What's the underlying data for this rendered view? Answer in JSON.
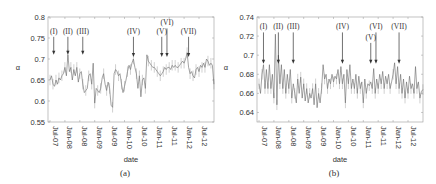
{
  "chart_data": [
    {
      "id": "a",
      "type": "line",
      "caption": "(a)",
      "xlabel": "date",
      "ylabel": "α",
      "ylim": [
        0.55,
        0.8
      ],
      "yticks": [
        0.55,
        0.6,
        0.65,
        0.7,
        0.75,
        0.8
      ],
      "ytick_labels": [
        "0.55",
        "0.6",
        "0.65",
        "0.7",
        "0.75",
        "0.8"
      ],
      "xticks": [
        "Jul-07",
        "Jan-08",
        "Jul-08",
        "Jan-09",
        "Jul-09",
        "Jan-10",
        "Jul-10",
        "Jan-11",
        "Jul-11",
        "Jan-12",
        "Jul-12"
      ],
      "grid": false,
      "annotations": [
        {
          "label": "(I)",
          "x_index": 0.25,
          "label_y": 0.76,
          "arrow_to": 0.71
        },
        {
          "label": "(II)",
          "x_index": 1.2,
          "label_y": 0.76,
          "arrow_to": 0.71
        },
        {
          "label": "(III)",
          "x_index": 2.2,
          "label_y": 0.76,
          "arrow_to": 0.71
        },
        {
          "label": "(IV)",
          "x_index": 5.6,
          "label_y": 0.76,
          "arrow_to": 0.705
        },
        {
          "label": "(V)",
          "x_index": 7.5,
          "label_y": 0.76,
          "arrow_to": 0.705
        },
        {
          "label": "(VI)",
          "x_index": 7.85,
          "label_y": 0.78,
          "arrow_to": 0.705
        },
        {
          "label": "(VII)",
          "x_index": 9.3,
          "label_y": 0.76,
          "arrow_to": 0.705
        }
      ],
      "series_summary": {
        "name": "α (weekly)",
        "points": [
          [
            0.0,
            0.65
          ],
          [
            0.1,
            0.66
          ],
          [
            0.2,
            0.64
          ],
          [
            0.3,
            0.635
          ],
          [
            0.4,
            0.65
          ],
          [
            0.5,
            0.64
          ],
          [
            0.6,
            0.655
          ],
          [
            0.7,
            0.65
          ],
          [
            0.8,
            0.66
          ],
          [
            0.9,
            0.665
          ],
          [
            1.0,
            0.68
          ],
          [
            1.1,
            0.66
          ],
          [
            1.2,
            0.71
          ],
          [
            1.3,
            0.67
          ],
          [
            1.4,
            0.68
          ],
          [
            1.5,
            0.65
          ],
          [
            1.6,
            0.675
          ],
          [
            1.7,
            0.66
          ],
          [
            1.8,
            0.68
          ],
          [
            1.9,
            0.645
          ],
          [
            2.0,
            0.665
          ],
          [
            2.1,
            0.67
          ],
          [
            2.2,
            0.64
          ],
          [
            2.3,
            0.62
          ],
          [
            2.4,
            0.625
          ],
          [
            2.5,
            0.63
          ],
          [
            2.6,
            0.66
          ],
          [
            2.7,
            0.665
          ],
          [
            2.8,
            0.64
          ],
          [
            2.9,
            0.69
          ],
          [
            3.0,
            0.595
          ],
          [
            3.1,
            0.63
          ],
          [
            3.2,
            0.625
          ],
          [
            3.3,
            0.62
          ],
          [
            3.4,
            0.63
          ],
          [
            3.5,
            0.655
          ],
          [
            3.6,
            0.665
          ],
          [
            3.7,
            0.64
          ],
          [
            3.8,
            0.625
          ],
          [
            3.9,
            0.645
          ],
          [
            4.0,
            0.63
          ],
          [
            4.1,
            0.59
          ],
          [
            4.2,
            0.585
          ],
          [
            4.3,
            0.665
          ],
          [
            4.4,
            0.675
          ],
          [
            4.5,
            0.67
          ],
          [
            4.6,
            0.66
          ],
          [
            4.7,
            0.665
          ],
          [
            4.8,
            0.64
          ],
          [
            4.9,
            0.62
          ],
          [
            5.0,
            0.635
          ],
          [
            5.1,
            0.65
          ],
          [
            5.2,
            0.67
          ],
          [
            5.3,
            0.685
          ],
          [
            5.4,
            0.675
          ],
          [
            5.5,
            0.69
          ],
          [
            5.6,
            0.7
          ],
          [
            5.7,
            0.68
          ],
          [
            5.8,
            0.665
          ],
          [
            5.9,
            0.63
          ],
          [
            6.0,
            0.66
          ],
          [
            6.1,
            0.61
          ],
          [
            6.2,
            0.65
          ],
          [
            6.3,
            0.655
          ],
          [
            6.4,
            0.63
          ],
          [
            6.5,
            0.71
          ],
          [
            6.6,
            0.695
          ],
          [
            6.7,
            0.69
          ],
          [
            6.8,
            0.685
          ],
          [
            6.9,
            0.68
          ],
          [
            7.0,
            0.68
          ],
          [
            7.1,
            0.675
          ],
          [
            7.2,
            0.67
          ],
          [
            7.3,
            0.665
          ],
          [
            7.4,
            0.66
          ],
          [
            7.5,
            0.665
          ],
          [
            7.6,
            0.67
          ],
          [
            7.7,
            0.68
          ],
          [
            7.8,
            0.675
          ],
          [
            7.9,
            0.68
          ],
          [
            8.0,
            0.68
          ],
          [
            8.1,
            0.675
          ],
          [
            8.2,
            0.685
          ],
          [
            8.3,
            0.68
          ],
          [
            8.4,
            0.685
          ],
          [
            8.5,
            0.68
          ],
          [
            8.6,
            0.68
          ],
          [
            8.7,
            0.685
          ],
          [
            8.8,
            0.69
          ],
          [
            8.9,
            0.695
          ],
          [
            9.0,
            0.69
          ],
          [
            9.1,
            0.7
          ],
          [
            9.2,
            0.715
          ],
          [
            9.3,
            0.68
          ],
          [
            9.4,
            0.665
          ],
          [
            9.5,
            0.67
          ],
          [
            9.6,
            0.66
          ],
          [
            9.7,
            0.655
          ],
          [
            9.8,
            0.675
          ],
          [
            9.9,
            0.68
          ],
          [
            10.0,
            0.67
          ],
          [
            10.1,
            0.685
          ],
          [
            10.2,
            0.68
          ],
          [
            10.3,
            0.69
          ],
          [
            10.4,
            0.68
          ],
          [
            10.5,
            0.7
          ],
          [
            10.6,
            0.695
          ],
          [
            10.7,
            0.685
          ],
          [
            10.8,
            0.69
          ],
          [
            10.9,
            0.685
          ],
          [
            11.0,
            0.64
          ]
        ]
      }
    },
    {
      "id": "b",
      "type": "line",
      "caption": "(b)",
      "xlabel": "date",
      "ylabel": "α",
      "ylim": [
        0.63,
        0.74
      ],
      "yticks": [
        0.64,
        0.66,
        0.68,
        0.7,
        0.72,
        0.74
      ],
      "ytick_labels": [
        "0.64",
        "0.66",
        "0.68",
        "0.7",
        "0.72",
        "0.74"
      ],
      "xticks": [
        "Jul-07",
        "Jan-08",
        "Jul-08",
        "Jan-09",
        "Jul-09",
        "Jan-10",
        "Jul-10",
        "Jan-11",
        "Jul-11",
        "Jan-12",
        "Jul-12"
      ],
      "grid": false,
      "annotations": [
        {
          "label": "(I)",
          "x_index": 0.3,
          "label_y": 0.727,
          "arrow_to": 0.691
        },
        {
          "label": "(II)",
          "x_index": 1.3,
          "label_y": 0.727,
          "arrow_to": 0.691
        },
        {
          "label": "(III)",
          "x_index": 2.3,
          "label_y": 0.727,
          "arrow_to": 0.691
        },
        {
          "label": "(IV)",
          "x_index": 5.6,
          "label_y": 0.727,
          "arrow_to": 0.691
        },
        {
          "label": "(V)",
          "x_index": 7.5,
          "label_y": 0.716,
          "arrow_to": 0.691
        },
        {
          "label": "(VI)",
          "x_index": 7.85,
          "label_y": 0.727,
          "arrow_to": 0.691
        },
        {
          "label": "(VII)",
          "x_index": 9.4,
          "label_y": 0.727,
          "arrow_to": 0.691
        }
      ],
      "series_summary": {
        "name": "α (weekly)",
        "points": [
          [
            0.0,
            0.67
          ],
          [
            0.1,
            0.66
          ],
          [
            0.2,
            0.68
          ],
          [
            0.3,
            0.69
          ],
          [
            0.4,
            0.665
          ],
          [
            0.5,
            0.685
          ],
          [
            0.6,
            0.665
          ],
          [
            0.7,
            0.69
          ],
          [
            0.8,
            0.665
          ],
          [
            0.9,
            0.68
          ],
          [
            1.0,
            0.655
          ],
          [
            1.1,
            0.722
          ],
          [
            1.2,
            0.648
          ],
          [
            1.3,
            0.7
          ],
          [
            1.4,
            0.67
          ],
          [
            1.5,
            0.69
          ],
          [
            1.6,
            0.665
          ],
          [
            1.7,
            0.685
          ],
          [
            1.8,
            0.66
          ],
          [
            1.9,
            0.68
          ],
          [
            2.0,
            0.665
          ],
          [
            2.1,
            0.685
          ],
          [
            2.2,
            0.655
          ],
          [
            2.3,
            0.67
          ],
          [
            2.4,
            0.66
          ],
          [
            2.5,
            0.65
          ],
          [
            2.6,
            0.675
          ],
          [
            2.7,
            0.66
          ],
          [
            2.8,
            0.677
          ],
          [
            2.9,
            0.655
          ],
          [
            3.0,
            0.67
          ],
          [
            3.1,
            0.652
          ],
          [
            3.2,
            0.665
          ],
          [
            3.3,
            0.65
          ],
          [
            3.4,
            0.66
          ],
          [
            3.5,
            0.655
          ],
          [
            3.6,
            0.665
          ],
          [
            3.7,
            0.648
          ],
          [
            3.8,
            0.67
          ],
          [
            3.9,
            0.645
          ],
          [
            4.0,
            0.66
          ],
          [
            4.1,
            0.65
          ],
          [
            4.2,
            0.665
          ],
          [
            4.3,
            0.69
          ],
          [
            4.4,
            0.675
          ],
          [
            4.5,
            0.68
          ],
          [
            4.6,
            0.665
          ],
          [
            4.7,
            0.675
          ],
          [
            4.8,
            0.67
          ],
          [
            4.9,
            0.68
          ],
          [
            5.0,
            0.672
          ],
          [
            5.1,
            0.678
          ],
          [
            5.2,
            0.675
          ],
          [
            5.3,
            0.685
          ],
          [
            5.4,
            0.67
          ],
          [
            5.5,
            0.688
          ],
          [
            5.6,
            0.67
          ],
          [
            5.7,
            0.68
          ],
          [
            5.8,
            0.65
          ],
          [
            5.9,
            0.685
          ],
          [
            6.0,
            0.67
          ],
          [
            6.1,
            0.69
          ],
          [
            6.2,
            0.665
          ],
          [
            6.3,
            0.675
          ],
          [
            6.4,
            0.665
          ],
          [
            6.5,
            0.68
          ],
          [
            6.6,
            0.66
          ],
          [
            6.7,
            0.678
          ],
          [
            6.8,
            0.665
          ],
          [
            6.9,
            0.672
          ],
          [
            7.0,
            0.65
          ],
          [
            7.1,
            0.675
          ],
          [
            7.2,
            0.66
          ],
          [
            7.3,
            0.67
          ],
          [
            7.4,
            0.668
          ],
          [
            7.5,
            0.672
          ],
          [
            7.6,
            0.665
          ],
          [
            7.7,
            0.686
          ],
          [
            7.8,
            0.66
          ],
          [
            7.9,
            0.675
          ],
          [
            8.0,
            0.665
          ],
          [
            8.1,
            0.68
          ],
          [
            8.2,
            0.67
          ],
          [
            8.3,
            0.683
          ],
          [
            8.4,
            0.665
          ],
          [
            8.5,
            0.678
          ],
          [
            8.6,
            0.67
          ],
          [
            8.7,
            0.68
          ],
          [
            8.8,
            0.665
          ],
          [
            8.9,
            0.672
          ],
          [
            9.0,
            0.68
          ],
          [
            9.1,
            0.692
          ],
          [
            9.2,
            0.67
          ],
          [
            9.3,
            0.688
          ],
          [
            9.4,
            0.665
          ],
          [
            9.5,
            0.68
          ],
          [
            9.6,
            0.66
          ],
          [
            9.7,
            0.675
          ],
          [
            9.8,
            0.655
          ],
          [
            9.9,
            0.672
          ],
          [
            10.0,
            0.66
          ],
          [
            10.1,
            0.678
          ],
          [
            10.2,
            0.665
          ],
          [
            10.3,
            0.67
          ],
          [
            10.4,
            0.66
          ],
          [
            10.5,
            0.688
          ],
          [
            10.6,
            0.665
          ],
          [
            10.7,
            0.672
          ],
          [
            10.8,
            0.655
          ],
          [
            10.9,
            0.662
          ],
          [
            11.0,
            0.664
          ]
        ]
      }
    }
  ]
}
